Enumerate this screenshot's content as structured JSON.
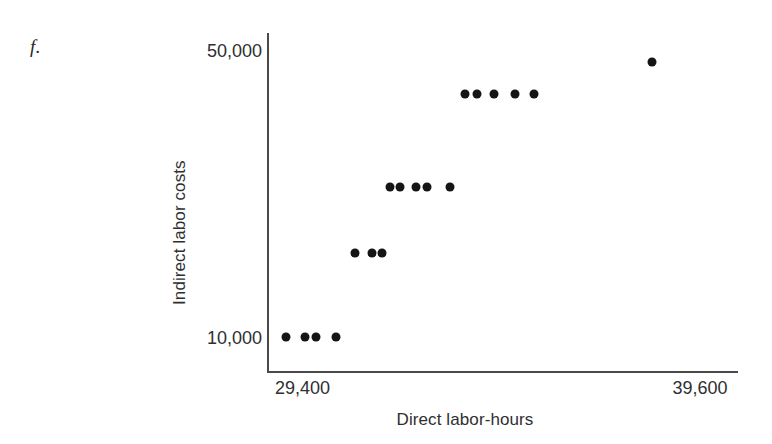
{
  "figure": {
    "part_label": "f."
  },
  "chart_data": {
    "type": "scatter",
    "title": "",
    "xlabel": "Direct labor-hours",
    "ylabel": "Indirect labor costs",
    "xlim": [
      29400,
      39600
    ],
    "ylim": [
      10000,
      50000
    ],
    "xticks": [
      29400,
      39600
    ],
    "xticklabels": [
      "29,400",
      "39,600"
    ],
    "yticks": [
      10000,
      50000
    ],
    "yticklabels": [
      "10,000",
      "50,000"
    ],
    "grid": false,
    "legend": null,
    "marker": "filled-circle",
    "marker_color": "#151515",
    "axis_color": "#4a4a4d",
    "background": "#ffffff",
    "n_points": 18,
    "points": [
      {
        "x": 29840,
        "y": 10000
      },
      {
        "x": 30290,
        "y": 10000
      },
      {
        "x": 30550,
        "y": 10000
      },
      {
        "x": 31030,
        "y": 10000
      },
      {
        "x": 31480,
        "y": 21050
      },
      {
        "x": 31890,
        "y": 21050
      },
      {
        "x": 32120,
        "y": 21050
      },
      {
        "x": 32300,
        "y": 29740
      },
      {
        "x": 32540,
        "y": 29740
      },
      {
        "x": 32930,
        "y": 29740
      },
      {
        "x": 33190,
        "y": 29740
      },
      {
        "x": 33730,
        "y": 29740
      },
      {
        "x": 34080,
        "y": 42000
      },
      {
        "x": 34380,
        "y": 42000
      },
      {
        "x": 34770,
        "y": 42000
      },
      {
        "x": 35270,
        "y": 42000
      },
      {
        "x": 35720,
        "y": 42000
      },
      {
        "x": 38510,
        "y": 46210
      }
    ],
    "clusters": [
      {
        "label": "lowest",
        "count": 4,
        "approx_y": 10000
      },
      {
        "label": "second",
        "count": 3,
        "approx_y": 21050
      },
      {
        "label": "third",
        "count": 5,
        "approx_y": 29740
      },
      {
        "label": "fourth",
        "count": 5,
        "approx_y": 42000
      },
      {
        "label": "outlier",
        "count": 1,
        "approx_y": 46210
      }
    ]
  }
}
